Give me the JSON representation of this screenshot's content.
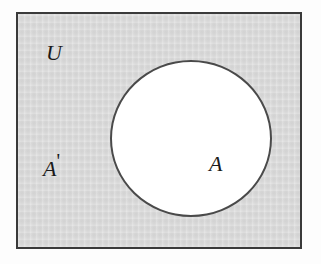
{
  "figure": {
    "type": "venn-diagram",
    "colors": {
      "universe_fill": "#d9d9d9",
      "universe_border": "#3a3a3a",
      "set_fill": "#ffffff",
      "set_border": "#4a4a4a",
      "label_color": "#1a1a1a",
      "page_background": "#fdfdfd"
    },
    "labels": {
      "universe": "U",
      "complement": "A",
      "complement_prime": "'",
      "set_a": "A"
    },
    "regions": [
      {
        "name": "universal-set",
        "label": "U",
        "shape": "rectangle",
        "fill": "#d9d9d9"
      },
      {
        "name": "set-a",
        "label": "A",
        "shape": "circle",
        "fill": "#ffffff"
      },
      {
        "name": "complement-of-a",
        "label": "A'",
        "shape": "rectangle-minus-circle",
        "fill": "#d9d9d9"
      }
    ]
  }
}
